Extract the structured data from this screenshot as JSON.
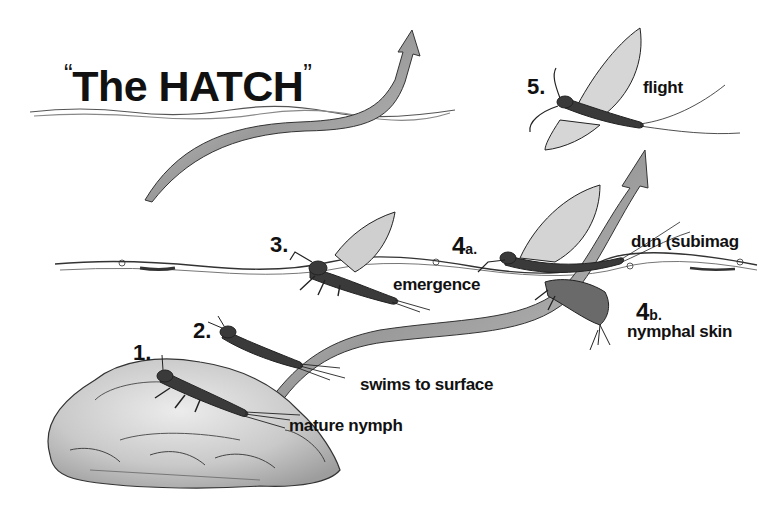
{
  "diagram": {
    "title": "The HATCH",
    "title_open_quote": "“",
    "title_close_quote": "”",
    "stages": [
      {
        "number": "1.",
        "suffix": "",
        "label": "mature nymph"
      },
      {
        "number": "2.",
        "suffix": "",
        "label": "swims to surface"
      },
      {
        "number": "3.",
        "suffix": "",
        "label": "emergence"
      },
      {
        "number": "4",
        "suffix": "a.",
        "label": "dun (subimag"
      },
      {
        "number": "4",
        "suffix": "b.",
        "label": "nymphal skin"
      },
      {
        "number": "5.",
        "suffix": "",
        "label": "flight"
      }
    ],
    "colors": {
      "ink": "#111111",
      "arrow_fill": "#9a9a9a",
      "arrow_edge": "#333333",
      "rock_fill": "#c8c8c8",
      "background": "#ffffff"
    }
  }
}
